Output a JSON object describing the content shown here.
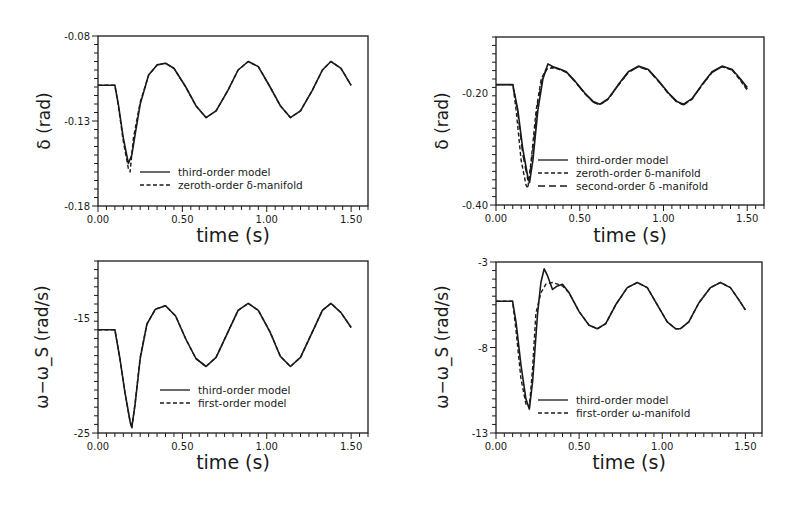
{
  "figure": {
    "background": "#ffffff",
    "ink_color": "#1a1a1a"
  },
  "chart_data": [
    {
      "id": "top-left",
      "type": "line",
      "title": "",
      "xlabel": "time (s)",
      "ylabel": "δ (rad)",
      "xlim": [
        0.0,
        1.6
      ],
      "ylim": [
        -0.18,
        -0.08
      ],
      "xticks": [
        0.0,
        0.5,
        1.0,
        1.5
      ],
      "xtick_labels": [
        "0.00",
        "0.50",
        "1.00",
        "1.50"
      ],
      "yticks": [
        -0.18,
        -0.13,
        -0.08
      ],
      "ytick_labels": [
        "-0.18",
        "-0.13",
        "-0.08"
      ],
      "grid": false,
      "legend_position": "lower center",
      "frame": {
        "x": 98,
        "y": 36,
        "w": 270,
        "h": 170
      },
      "legend": {
        "x": 140,
        "y": 172
      },
      "series": [
        {
          "name": "third-order model",
          "style": "solid",
          "x": [
            0.0,
            0.1,
            0.12,
            0.15,
            0.18,
            0.2,
            0.22,
            0.25,
            0.3,
            0.35,
            0.4,
            0.45,
            0.52,
            0.58,
            0.64,
            0.7,
            0.77,
            0.83,
            0.89,
            0.95,
            1.02,
            1.08,
            1.14,
            1.2,
            1.27,
            1.33,
            1.38,
            1.44,
            1.5
          ],
          "y": [
            -0.109,
            -0.109,
            -0.12,
            -0.14,
            -0.155,
            -0.15,
            -0.138,
            -0.12,
            -0.103,
            -0.097,
            -0.096,
            -0.099,
            -0.11,
            -0.121,
            -0.128,
            -0.124,
            -0.112,
            -0.1,
            -0.095,
            -0.098,
            -0.11,
            -0.121,
            -0.128,
            -0.124,
            -0.112,
            -0.1,
            -0.095,
            -0.099,
            -0.109
          ]
        },
        {
          "name": "zeroth-order δ-manifold",
          "style": "dashed",
          "x": [
            0.0,
            0.1,
            0.12,
            0.15,
            0.18,
            0.19,
            0.21,
            0.25,
            0.3,
            0.35,
            0.4,
            0.45,
            0.52,
            0.58,
            0.64,
            0.7,
            0.77,
            0.83,
            0.89,
            0.95,
            1.02,
            1.08,
            1.14,
            1.2,
            1.27,
            1.33,
            1.38,
            1.44,
            1.5
          ],
          "y": [
            -0.109,
            -0.109,
            -0.121,
            -0.142,
            -0.158,
            -0.16,
            -0.14,
            -0.119,
            -0.103,
            -0.097,
            -0.096,
            -0.099,
            -0.11,
            -0.121,
            -0.128,
            -0.124,
            -0.112,
            -0.1,
            -0.095,
            -0.098,
            -0.11,
            -0.121,
            -0.128,
            -0.124,
            -0.112,
            -0.1,
            -0.095,
            -0.099,
            -0.109
          ]
        }
      ]
    },
    {
      "id": "top-right",
      "type": "line",
      "title": "",
      "xlabel": "time (s)",
      "ylabel": "δ (rad)",
      "xlim": [
        0.0,
        1.6
      ],
      "ylim": [
        -0.4,
        -0.1
      ],
      "xticks": [
        0.0,
        0.5,
        1.0,
        1.5
      ],
      "xtick_labels": [
        "0.00",
        "0.50",
        "1.00",
        "1.50"
      ],
      "yticks": [
        -0.4,
        -0.2
      ],
      "ytick_labels": [
        "-0.40",
        "-0.20"
      ],
      "grid": false,
      "legend_position": "lower center",
      "frame": {
        "x": 496,
        "y": 37,
        "w": 268,
        "h": 168
      },
      "legend": {
        "x": 538,
        "y": 160
      },
      "series": [
        {
          "name": "third-order model",
          "style": "solid",
          "x": [
            0.0,
            0.1,
            0.13,
            0.16,
            0.19,
            0.2,
            0.22,
            0.25,
            0.28,
            0.31,
            0.34,
            0.38,
            0.42,
            0.47,
            0.53,
            0.58,
            0.62,
            0.67,
            0.73,
            0.79,
            0.85,
            0.91,
            0.97,
            1.03,
            1.08,
            1.12,
            1.17,
            1.23,
            1.29,
            1.35,
            1.41,
            1.46,
            1.5
          ],
          "y": [
            -0.185,
            -0.185,
            -0.23,
            -0.3,
            -0.35,
            -0.36,
            -0.32,
            -0.23,
            -0.175,
            -0.148,
            -0.153,
            -0.157,
            -0.162,
            -0.178,
            -0.2,
            -0.215,
            -0.22,
            -0.21,
            -0.185,
            -0.162,
            -0.152,
            -0.158,
            -0.178,
            -0.2,
            -0.215,
            -0.22,
            -0.21,
            -0.185,
            -0.162,
            -0.152,
            -0.158,
            -0.175,
            -0.19
          ]
        },
        {
          "name": "zeroth-order δ-manifold",
          "style": "dashed",
          "x": [
            0.0,
            0.1,
            0.12,
            0.15,
            0.18,
            0.19,
            0.21,
            0.24,
            0.27,
            0.3,
            0.34,
            0.38,
            0.42,
            0.47,
            0.53,
            0.58,
            0.62,
            0.67,
            0.73,
            0.79,
            0.85,
            0.91,
            0.97,
            1.03,
            1.08,
            1.12,
            1.17,
            1.23,
            1.29,
            1.35,
            1.41,
            1.46,
            1.5
          ],
          "y": [
            -0.185,
            -0.185,
            -0.23,
            -0.32,
            -0.365,
            -0.37,
            -0.32,
            -0.23,
            -0.175,
            -0.157,
            -0.155,
            -0.158,
            -0.163,
            -0.179,
            -0.201,
            -0.216,
            -0.221,
            -0.211,
            -0.186,
            -0.163,
            -0.153,
            -0.159,
            -0.179,
            -0.201,
            -0.216,
            -0.221,
            -0.211,
            -0.186,
            -0.163,
            -0.153,
            -0.159,
            -0.178,
            -0.195
          ]
        },
        {
          "name": "second-order δ -manifold",
          "style": "longdash",
          "x": [
            0.0,
            0.1,
            0.13,
            0.16,
            0.19,
            0.2,
            0.22,
            0.25,
            0.28,
            0.31,
            0.34,
            0.38,
            0.42,
            0.47,
            0.53,
            0.58,
            0.62,
            0.67,
            0.73,
            0.79,
            0.85,
            0.91,
            0.97,
            1.03,
            1.08,
            1.12,
            1.17,
            1.23,
            1.29,
            1.35,
            1.41,
            1.46,
            1.5
          ],
          "y": [
            -0.185,
            -0.185,
            -0.235,
            -0.31,
            -0.355,
            -0.35,
            -0.3,
            -0.215,
            -0.17,
            -0.155,
            -0.154,
            -0.157,
            -0.163,
            -0.179,
            -0.201,
            -0.216,
            -0.221,
            -0.211,
            -0.186,
            -0.163,
            -0.153,
            -0.159,
            -0.179,
            -0.201,
            -0.216,
            -0.221,
            -0.211,
            -0.186,
            -0.163,
            -0.153,
            -0.159,
            -0.176,
            -0.193
          ]
        }
      ]
    },
    {
      "id": "bottom-left",
      "type": "line",
      "title": "",
      "xlabel": "time (s)",
      "ylabel": "ω−ω_S (rad/s)",
      "xlim": [
        0.0,
        1.6
      ],
      "ylim": [
        -25,
        -10
      ],
      "xticks": [
        0.0,
        0.5,
        1.0,
        1.5
      ],
      "xtick_labels": [
        "0.00",
        "0.50",
        "1.00",
        "1.50"
      ],
      "yticks": [
        -25,
        -15
      ],
      "ytick_labels": [
        "-25",
        "-15"
      ],
      "grid": false,
      "legend_position": "lower right",
      "frame": {
        "x": 98,
        "y": 261,
        "w": 270,
        "h": 172
      },
      "legend": {
        "x": 160,
        "y": 390
      },
      "series": [
        {
          "name": "third-order model",
          "style": "solid",
          "x": [
            0.0,
            0.1,
            0.13,
            0.16,
            0.19,
            0.2,
            0.22,
            0.25,
            0.29,
            0.34,
            0.4,
            0.46,
            0.52,
            0.58,
            0.64,
            0.7,
            0.77,
            0.83,
            0.89,
            0.95,
            1.02,
            1.08,
            1.14,
            1.2,
            1.27,
            1.33,
            1.38,
            1.44,
            1.5
          ],
          "y": [
            -16.0,
            -16.0,
            -18.5,
            -21.5,
            -24.0,
            -24.5,
            -22.5,
            -18.5,
            -15.5,
            -14.2,
            -13.9,
            -14.8,
            -16.8,
            -18.5,
            -19.2,
            -18.4,
            -16.2,
            -14.3,
            -13.7,
            -14.3,
            -16.2,
            -18.3,
            -19.2,
            -18.4,
            -16.2,
            -14.3,
            -13.7,
            -14.5,
            -15.8
          ]
        },
        {
          "name": "first-order model",
          "style": "dashed",
          "x": [
            0.0,
            0.1,
            0.13,
            0.16,
            0.19,
            0.2,
            0.22,
            0.25,
            0.29,
            0.34,
            0.4,
            0.46,
            0.52,
            0.58,
            0.64,
            0.7,
            0.77,
            0.83,
            0.89,
            0.95,
            1.02,
            1.08,
            1.14,
            1.2,
            1.27,
            1.33,
            1.38,
            1.44,
            1.5
          ],
          "y": [
            -16.0,
            -16.0,
            -18.5,
            -21.5,
            -24.0,
            -24.6,
            -22.4,
            -18.4,
            -15.5,
            -14.2,
            -13.9,
            -14.8,
            -16.8,
            -18.5,
            -19.2,
            -18.4,
            -16.2,
            -14.3,
            -13.7,
            -14.3,
            -16.2,
            -18.3,
            -19.2,
            -18.4,
            -16.2,
            -14.3,
            -13.7,
            -14.5,
            -15.8
          ]
        }
      ]
    },
    {
      "id": "bottom-right",
      "type": "line",
      "title": "",
      "xlabel": "time (s)",
      "ylabel": "ω−ω_S (rad/s)",
      "xlim": [
        0.0,
        1.6
      ],
      "ylim": [
        -13,
        -3
      ],
      "xticks": [
        0.0,
        0.5,
        1.0,
        1.5
      ],
      "xtick_labels": [
        "0.00",
        "0.50",
        "1.00",
        "1.50"
      ],
      "yticks": [
        -13,
        -8,
        -3
      ],
      "ytick_labels": [
        "-13",
        "-8",
        "-3"
      ],
      "grid": false,
      "legend_position": "lower center",
      "frame": {
        "x": 496,
        "y": 262,
        "w": 266,
        "h": 171
      },
      "legend": {
        "x": 538,
        "y": 400
      },
      "series": [
        {
          "name": "third-order model",
          "style": "solid",
          "x": [
            0.0,
            0.1,
            0.12,
            0.15,
            0.18,
            0.2,
            0.22,
            0.25,
            0.27,
            0.29,
            0.31,
            0.34,
            0.37,
            0.4,
            0.44,
            0.5,
            0.56,
            0.61,
            0.66,
            0.72,
            0.79,
            0.85,
            0.91,
            0.97,
            1.03,
            1.08,
            1.11,
            1.16,
            1.22,
            1.29,
            1.35,
            1.41,
            1.46,
            1.5
          ],
          "y": [
            -5.3,
            -5.3,
            -6.5,
            -9.0,
            -11.0,
            -11.6,
            -10.0,
            -6.0,
            -4.2,
            -3.4,
            -3.8,
            -4.6,
            -4.4,
            -4.3,
            -4.8,
            -5.9,
            -6.7,
            -6.9,
            -6.6,
            -5.5,
            -4.5,
            -4.2,
            -4.5,
            -5.5,
            -6.5,
            -6.9,
            -6.9,
            -6.5,
            -5.4,
            -4.5,
            -4.2,
            -4.5,
            -5.2,
            -5.8
          ]
        },
        {
          "name": "first-order ω-manifold",
          "style": "dashed",
          "x": [
            0.0,
            0.1,
            0.12,
            0.15,
            0.18,
            0.2,
            0.22,
            0.24,
            0.27,
            0.3,
            0.34,
            0.37,
            0.4,
            0.44,
            0.5,
            0.56,
            0.61,
            0.66,
            0.72,
            0.79,
            0.85,
            0.91,
            0.97,
            1.03,
            1.08,
            1.11,
            1.16,
            1.22,
            1.29,
            1.35,
            1.41,
            1.46,
            1.5
          ],
          "y": [
            -5.3,
            -5.3,
            -7.0,
            -9.8,
            -11.3,
            -11.5,
            -9.2,
            -6.0,
            -4.8,
            -4.3,
            -4.2,
            -4.3,
            -4.4,
            -4.8,
            -5.9,
            -6.7,
            -6.9,
            -6.6,
            -5.5,
            -4.5,
            -4.2,
            -4.5,
            -5.5,
            -6.5,
            -6.9,
            -6.9,
            -6.5,
            -5.4,
            -4.5,
            -4.2,
            -4.5,
            -5.2,
            -5.8
          ]
        }
      ]
    }
  ]
}
